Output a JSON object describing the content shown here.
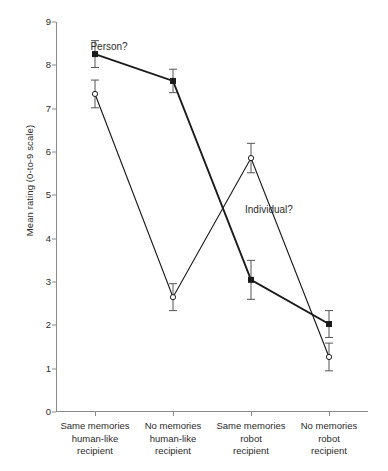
{
  "chart_data": {
    "type": "line",
    "title": "",
    "xlabel": "",
    "ylabel": "Mean rating (0-to-9 scale)",
    "ylim": [
      0,
      9
    ],
    "yticks": [
      0,
      1,
      2,
      3,
      4,
      5,
      6,
      7,
      8,
      9
    ],
    "ytick_labels": [
      "0",
      "1",
      "2",
      "3",
      "4",
      "5",
      "6",
      "7",
      "8",
      "9"
    ],
    "grid": false,
    "legend_position": "inline-annotations",
    "categories": [
      "Same memories human-like recipient",
      "No memories human-like recipient",
      "Same memories robot recipient",
      "No memories robot recipient"
    ],
    "category_lines": [
      [
        "Same memories",
        "human-like",
        "recipient"
      ],
      [
        "No memories",
        "human-like",
        "recipient"
      ],
      [
        "Same memories",
        "robot",
        "recipient"
      ],
      [
        "No memories",
        "robot",
        "recipient"
      ]
    ],
    "series": [
      {
        "name": "Person?",
        "marker": "filled-square",
        "color": "#1a1a1a",
        "values": [
          8.26,
          7.64,
          3.05,
          2.03
        ],
        "errors": [
          0.31,
          0.27,
          0.45,
          0.31
        ]
      },
      {
        "name": "Individual?",
        "marker": "open-circle",
        "color": "#1a1a1a",
        "values": [
          7.34,
          2.65,
          5.86,
          1.27
        ],
        "errors": [
          0.32,
          0.31,
          0.34,
          0.32
        ]
      }
    ],
    "annotations": [
      {
        "text": "Person?",
        "series": "Person?",
        "x_value": 1.18,
        "y_value": 8.45
      },
      {
        "text": "Individual?",
        "series": "Individual?",
        "x_value": 3.23,
        "y_value": 4.68
      }
    ]
  },
  "axis": {
    "y_title": "Mean rating (0-to-9 scale)"
  }
}
